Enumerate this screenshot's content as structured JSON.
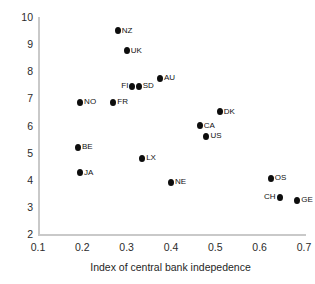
{
  "chart_data": {
    "type": "scatter",
    "title": "",
    "subtitle": "",
    "xlabel": "Index of central bank indepedence",
    "ylabel": "",
    "xlim": [
      0.1,
      0.7
    ],
    "ylim": [
      2,
      10
    ],
    "xticks": [
      "0.1",
      "0.2",
      "0.3",
      "0.4",
      "0.5",
      "0.6",
      "0.7"
    ],
    "yticks": [
      "2",
      "3",
      "4",
      "5",
      "6",
      "7",
      "8",
      "9",
      "10"
    ],
    "grid": false,
    "legend": false,
    "marker_color": "#0d0d0d",
    "axis_color": "#c9c9c9",
    "points": [
      {
        "label": "NZ",
        "x": 0.28,
        "y": 9.5,
        "label_side": "right"
      },
      {
        "label": "UK",
        "x": 0.3,
        "y": 8.75,
        "label_side": "right"
      },
      {
        "label": "AU",
        "x": 0.375,
        "y": 7.75,
        "label_side": "right"
      },
      {
        "label": "FI",
        "x": 0.313,
        "y": 7.45,
        "label_side": "left"
      },
      {
        "label": "SD",
        "x": 0.327,
        "y": 7.45,
        "label_side": "right"
      },
      {
        "label": "NO",
        "x": 0.195,
        "y": 6.85,
        "label_side": "right"
      },
      {
        "label": "FR",
        "x": 0.27,
        "y": 6.85,
        "label_side": "right"
      },
      {
        "label": "DK",
        "x": 0.51,
        "y": 6.5,
        "label_side": "right"
      },
      {
        "label": "CA",
        "x": 0.465,
        "y": 6.0,
        "label_side": "right"
      },
      {
        "label": "US",
        "x": 0.48,
        "y": 5.6,
        "label_side": "right"
      },
      {
        "label": "BE",
        "x": 0.19,
        "y": 5.2,
        "label_side": "right"
      },
      {
        "label": "LX",
        "x": 0.335,
        "y": 4.8,
        "label_side": "right"
      },
      {
        "label": "JA",
        "x": 0.195,
        "y": 4.25,
        "label_side": "right"
      },
      {
        "label": "OS",
        "x": 0.625,
        "y": 4.05,
        "label_side": "right"
      },
      {
        "label": "NE",
        "x": 0.4,
        "y": 3.9,
        "label_side": "right"
      },
      {
        "label": "CH",
        "x": 0.645,
        "y": 3.35,
        "label_side": "left"
      },
      {
        "label": "GE",
        "x": 0.685,
        "y": 3.25,
        "label_side": "right"
      }
    ]
  }
}
